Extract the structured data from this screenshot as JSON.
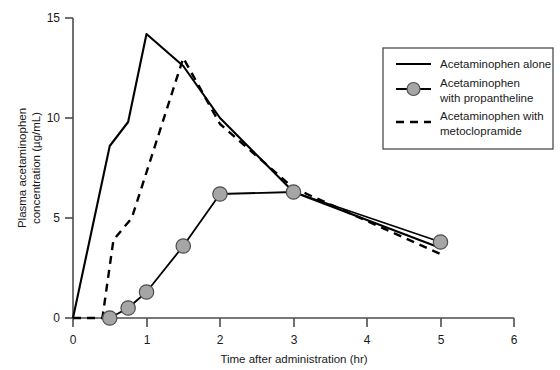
{
  "chart_data": {
    "type": "line",
    "title": "",
    "xlabel": "Time after administration (hr)",
    "ylabel": "Plasma acetaminophen concentration (µg/mL)",
    "xlim": [
      0,
      6
    ],
    "ylim": [
      0,
      15
    ],
    "xticks": [
      "0",
      "1",
      "2",
      "3",
      "4",
      "5",
      "6"
    ],
    "yticks": [
      "0",
      "5",
      "10",
      "15"
    ],
    "grid": false,
    "legend_position": "top-right",
    "series": [
      {
        "name": "Acetaminophen alone",
        "style": "solid",
        "markers": false,
        "color": "#000000",
        "x": [
          0,
          0.5,
          0.75,
          1,
          1.5,
          2,
          3,
          5
        ],
        "y": [
          0,
          8.6,
          9.8,
          14.2,
          12.6,
          10.0,
          6.3,
          3.5
        ]
      },
      {
        "name": "Acetaminophen with propantheline",
        "style": "solid",
        "markers": true,
        "color": "#000000",
        "marker_fill": "#a6a6a6",
        "x": [
          0.5,
          0.75,
          1,
          1.5,
          2,
          3,
          5
        ],
        "y": [
          0.0,
          0.5,
          1.3,
          3.6,
          6.2,
          6.3,
          3.8
        ]
      },
      {
        "name": "Acetaminophen with metoclopramide",
        "style": "dashed",
        "markers": false,
        "color": "#000000",
        "x": [
          0,
          0.4,
          0.55,
          0.8,
          1.5,
          2,
          3,
          5
        ],
        "y": [
          0,
          0.0,
          3.9,
          5.0,
          13.0,
          9.7,
          6.5,
          3.2
        ]
      }
    ]
  },
  "legend": {
    "items": [
      {
        "label": "Acetaminophen alone",
        "style": "solid",
        "marker": false
      },
      {
        "label_line1": "Acetaminophen",
        "label_line2": "with propantheline",
        "style": "solid",
        "marker": true
      },
      {
        "label_line1": "Acetaminophen with",
        "label_line2": "metoclopramide",
        "style": "dashed",
        "marker": false
      }
    ]
  },
  "colors": {
    "axis": "#4d4d4d",
    "line": "#000000",
    "marker_fill": "#a6a6a6",
    "marker_edge": "#4d4d4d",
    "legend_border": "#4d4d4d",
    "background": "#ffffff"
  }
}
